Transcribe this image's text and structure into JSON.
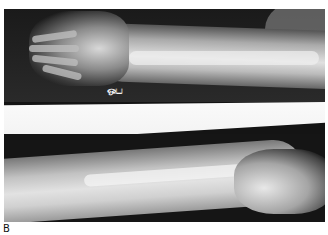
{
  "figure": {
    "panel_label": "B",
    "marker_text": "ஒப"
  },
  "colors": {
    "film_dark": "#141414",
    "bone": "#f0f0f0",
    "soft_tissue": "#aaaaaa",
    "band": "#f8f8f8",
    "background": "#ffffff"
  }
}
